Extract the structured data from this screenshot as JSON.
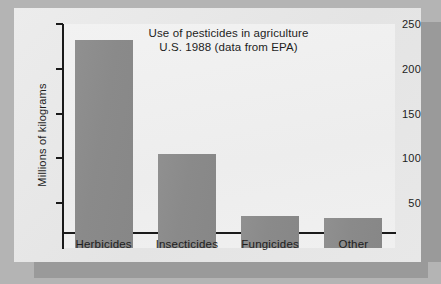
{
  "chart_data": {
    "type": "bar",
    "title": "Use of pesticides in agriculture",
    "subtitle": "U.S. 1988 (data from EPA)",
    "xlabel": "",
    "ylabel": "Millions of kilograms",
    "categories": [
      "Herbicides",
      "Insecticides",
      "Fungicides",
      "Other"
    ],
    "values": [
      232,
      105,
      36,
      34
    ],
    "yticks": [
      50,
      100,
      150,
      200,
      250
    ],
    "ylim": [
      0,
      250
    ],
    "grid": false,
    "legend": false,
    "bar_color": "#8c8c8c",
    "plot_background": "#efefef",
    "figure_background": "#e9e9e9",
    "page_background": "#b4b4b4",
    "axis_color": "#1a1a1a",
    "text_color": "#1d1d1d"
  }
}
